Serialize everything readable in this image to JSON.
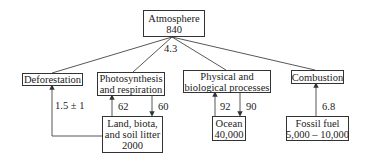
{
  "diagram": {
    "type": "carbon-cycle-flow",
    "nodes": {
      "atmosphere": {
        "line1": "Atmosphere",
        "line2": "840"
      },
      "deforestation": {
        "line1": "Deforestation"
      },
      "photosynthesis": {
        "line1": "Photosynthesis",
        "line2": "and respiration"
      },
      "physical": {
        "line1": "Physical and",
        "line2": "biological processes"
      },
      "combustion": {
        "line1": "Combustion"
      },
      "land": {
        "line1": "Land, biota,",
        "line2": "and soil litter",
        "line3": "2000"
      },
      "ocean": {
        "line1": "Ocean",
        "line2": "40,000"
      },
      "fossil": {
        "line1": "Fossil fuel",
        "line2": "5,000 – 10,000"
      }
    },
    "edge_labels": {
      "atmosphere_net": "4.3",
      "deforestation": "1.5 ± 1",
      "land_to_photo": "62",
      "photo_to_land": "60",
      "ocean_to_phys": "92",
      "phys_to_ocean": "90",
      "fossil_to_combustion": "6.8"
    }
  }
}
